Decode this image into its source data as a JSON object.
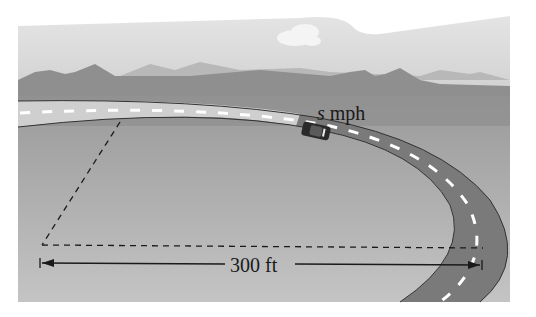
{
  "figure": {
    "speed_label": {
      "variable": "s",
      "unit": "mph"
    },
    "distance_label": "300 ft",
    "colors": {
      "sky": "#d9d9d9",
      "ground": "#9e9e9e",
      "mountains": "#8a8a8a",
      "road_straight": "#c9c9c9",
      "road_curve": "#707070",
      "lane_markings": "#ffffff",
      "dimension_lines": "#1a1a1a"
    }
  }
}
